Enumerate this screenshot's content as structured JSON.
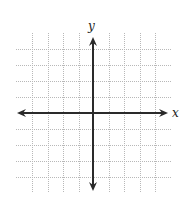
{
  "diagram": {
    "type": "coordinate-plane",
    "x_axis_label": "x",
    "y_axis_label": "y",
    "grid": {
      "vertical_lines_x": [
        32,
        48,
        63,
        79,
        109,
        124,
        140,
        155
      ],
      "horizontal_lines_y": [
        49,
        65,
        81,
        97,
        129,
        145,
        161,
        177
      ],
      "extent": {
        "x1": 16,
        "x2": 171,
        "y1": 33,
        "y2": 193
      },
      "color": "#b8b8b8",
      "style": "dotted"
    },
    "axes": {
      "color": "#2a2a2a",
      "origin": {
        "x": 93,
        "y": 113
      },
      "x_axis": {
        "x1": 17,
        "x2": 168
      },
      "y_axis": {
        "y1": 37,
        "y2": 191
      }
    },
    "labels": {
      "x": {
        "x": 172,
        "y": 117
      },
      "y": {
        "x": 88,
        "y": 30
      }
    }
  }
}
